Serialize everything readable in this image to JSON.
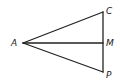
{
  "diagram": {
    "type": "geometry",
    "stroke_color": "#222222",
    "points": [
      {
        "id": "A",
        "label": "A",
        "x": 23,
        "y": 43,
        "label_x": 11,
        "label_y": 46
      },
      {
        "id": "C",
        "label": "C",
        "x": 103,
        "y": 12,
        "label_x": 106,
        "label_y": 14
      },
      {
        "id": "M",
        "label": "M",
        "x": 103,
        "y": 43,
        "label_x": 106,
        "label_y": 46
      },
      {
        "id": "P",
        "label": "P",
        "x": 103,
        "y": 72,
        "label_x": 106,
        "label_y": 78
      }
    ],
    "segments": [
      {
        "from": "A",
        "to": "C"
      },
      {
        "from": "A",
        "to": "M"
      },
      {
        "from": "A",
        "to": "P"
      },
      {
        "from": "C",
        "to": "P"
      }
    ]
  }
}
